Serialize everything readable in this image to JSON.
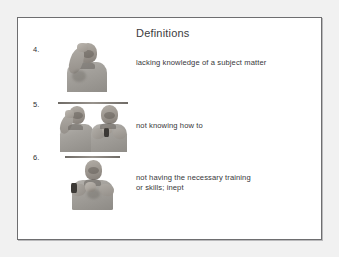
{
  "slide": {
    "title": "Definitions",
    "items": [
      {
        "number": "4.",
        "definition": "lacking knowledge of a subject matter",
        "image_name": "sign-photo-ignorant"
      },
      {
        "number": "5.",
        "definition": "not knowing how to",
        "image_name": "sign-photo-dont-know-how"
      },
      {
        "number": "6.",
        "definition": "not having the necessary training\nor skills; inept",
        "image_name": "sign-photo-unskilled"
      }
    ]
  },
  "colors": {
    "page_background": "#f1f1f1",
    "slide_background": "#ffffff",
    "slide_border": "#6e6e70",
    "title_text": "#3b3b3d",
    "body_text": "#37373a"
  }
}
